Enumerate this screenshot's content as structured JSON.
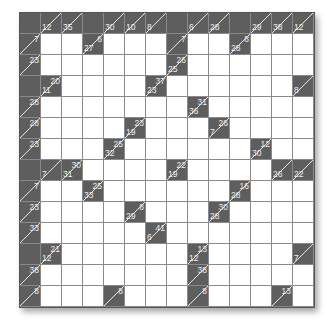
{
  "puzzle": {
    "type": "kakuro",
    "rows": 14,
    "cols": 14,
    "colors": {
      "block": "#5e5e5e",
      "empty": "#ffffff",
      "grid_line": "#8a8a8a",
      "clue_text": "#f0f0f0"
    },
    "grid": [
      [
        {
          "t": "b"
        },
        {
          "t": "c",
          "d": 12
        },
        {
          "t": "c",
          "d": 35
        },
        {
          "t": "b"
        },
        {
          "t": "c",
          "d": 30
        },
        {
          "t": "c",
          "d": 10
        },
        {
          "t": "c",
          "d": 8
        },
        {
          "t": "b"
        },
        {
          "t": "c",
          "d": 6
        },
        {
          "t": "c",
          "d": 28
        },
        {
          "t": "b"
        },
        {
          "t": "c",
          "d": 29
        },
        {
          "t": "c",
          "d": 38
        },
        {
          "t": "c",
          "d": 12
        }
      ],
      [
        {
          "t": "c",
          "a": 7
        },
        {
          "t": "w"
        },
        {
          "t": "w"
        },
        {
          "t": "c",
          "d": 27,
          "a": 6
        },
        {
          "t": "w"
        },
        {
          "t": "w"
        },
        {
          "t": "w"
        },
        {
          "t": "c",
          "a": 7
        },
        {
          "t": "w"
        },
        {
          "t": "w"
        },
        {
          "t": "c",
          "d": 28,
          "a": 8
        },
        {
          "t": "w"
        },
        {
          "t": "w"
        },
        {
          "t": "w"
        }
      ],
      [
        {
          "t": "c",
          "a": 23
        },
        {
          "t": "w"
        },
        {
          "t": "w"
        },
        {
          "t": "w"
        },
        {
          "t": "w"
        },
        {
          "t": "w"
        },
        {
          "t": "w"
        },
        {
          "t": "c",
          "d": 25,
          "a": 26
        },
        {
          "t": "w"
        },
        {
          "t": "w"
        },
        {
          "t": "w"
        },
        {
          "t": "w"
        },
        {
          "t": "w"
        },
        {
          "t": "w"
        }
      ],
      [
        {
          "t": "b"
        },
        {
          "t": "c",
          "d": 11,
          "a": 20
        },
        {
          "t": "w"
        },
        {
          "t": "w"
        },
        {
          "t": "w"
        },
        {
          "t": "w"
        },
        {
          "t": "c",
          "d": 23,
          "a": 37
        },
        {
          "t": "w"
        },
        {
          "t": "w"
        },
        {
          "t": "w"
        },
        {
          "t": "w"
        },
        {
          "t": "w"
        },
        {
          "t": "w"
        },
        {
          "t": "c",
          "d": 8
        }
      ],
      [
        {
          "t": "c",
          "a": 28
        },
        {
          "t": "w"
        },
        {
          "t": "w"
        },
        {
          "t": "w"
        },
        {
          "t": "w"
        },
        {
          "t": "w"
        },
        {
          "t": "w"
        },
        {
          "t": "w"
        },
        {
          "t": "c",
          "d": 36,
          "a": 31
        },
        {
          "t": "w"
        },
        {
          "t": "w"
        },
        {
          "t": "w"
        },
        {
          "t": "w"
        },
        {
          "t": "w"
        }
      ],
      [
        {
          "t": "c",
          "a": 28
        },
        {
          "t": "w"
        },
        {
          "t": "w"
        },
        {
          "t": "w"
        },
        {
          "t": "w"
        },
        {
          "t": "c",
          "d": 19,
          "a": 23
        },
        {
          "t": "w"
        },
        {
          "t": "w"
        },
        {
          "t": "w"
        },
        {
          "t": "c",
          "d": 7,
          "a": 26
        },
        {
          "t": "w"
        },
        {
          "t": "w"
        },
        {
          "t": "w"
        },
        {
          "t": "w"
        }
      ],
      [
        {
          "t": "c",
          "a": 23
        },
        {
          "t": "w"
        },
        {
          "t": "w"
        },
        {
          "t": "w"
        },
        {
          "t": "c",
          "d": 32,
          "a": 25
        },
        {
          "t": "w"
        },
        {
          "t": "w"
        },
        {
          "t": "w"
        },
        {
          "t": "w"
        },
        {
          "t": "w"
        },
        {
          "t": "w"
        },
        {
          "t": "c",
          "d": 30,
          "a": 12
        },
        {
          "t": "w"
        },
        {
          "t": "w"
        }
      ],
      [
        {
          "t": "b"
        },
        {
          "t": "c",
          "d": 7
        },
        {
          "t": "c",
          "d": 31,
          "a": 30
        },
        {
          "t": "w"
        },
        {
          "t": "w"
        },
        {
          "t": "w"
        },
        {
          "t": "w"
        },
        {
          "t": "c",
          "d": 19,
          "a": 22
        },
        {
          "t": "w"
        },
        {
          "t": "w"
        },
        {
          "t": "w"
        },
        {
          "t": "w"
        },
        {
          "t": "c",
          "d": 26
        },
        {
          "t": "c",
          "d": 22
        }
      ],
      [
        {
          "t": "c",
          "a": 7
        },
        {
          "t": "w"
        },
        {
          "t": "w"
        },
        {
          "t": "c",
          "d": 33,
          "a": 25
        },
        {
          "t": "w"
        },
        {
          "t": "w"
        },
        {
          "t": "w"
        },
        {
          "t": "w"
        },
        {
          "t": "w"
        },
        {
          "t": "w"
        },
        {
          "t": "c",
          "d": 28,
          "a": 16
        },
        {
          "t": "w"
        },
        {
          "t": "w"
        },
        {
          "t": "w"
        }
      ],
      [
        {
          "t": "c",
          "a": 23
        },
        {
          "t": "w"
        },
        {
          "t": "w"
        },
        {
          "t": "w"
        },
        {
          "t": "w"
        },
        {
          "t": "c",
          "d": 29,
          "a": 8
        },
        {
          "t": "w"
        },
        {
          "t": "w"
        },
        {
          "t": "w"
        },
        {
          "t": "c",
          "d": 28,
          "a": 30
        },
        {
          "t": "w"
        },
        {
          "t": "w"
        },
        {
          "t": "w"
        },
        {
          "t": "w"
        }
      ],
      [
        {
          "t": "c",
          "a": 33
        },
        {
          "t": "w"
        },
        {
          "t": "w"
        },
        {
          "t": "w"
        },
        {
          "t": "w"
        },
        {
          "t": "w"
        },
        {
          "t": "c",
          "d": 6,
          "a": 41
        },
        {
          "t": "w"
        },
        {
          "t": "w"
        },
        {
          "t": "w"
        },
        {
          "t": "w"
        },
        {
          "t": "w"
        },
        {
          "t": "w"
        },
        {
          "t": "w"
        }
      ],
      [
        {
          "t": "b"
        },
        {
          "t": "c",
          "d": 12,
          "a": 21
        },
        {
          "t": "w"
        },
        {
          "t": "w"
        },
        {
          "t": "w"
        },
        {
          "t": "w"
        },
        {
          "t": "w"
        },
        {
          "t": "w"
        },
        {
          "t": "c",
          "d": 12,
          "a": 13
        },
        {
          "t": "w"
        },
        {
          "t": "w"
        },
        {
          "t": "w"
        },
        {
          "t": "w"
        },
        {
          "t": "c",
          "d": 7
        }
      ],
      [
        {
          "t": "c",
          "a": 38
        },
        {
          "t": "w"
        },
        {
          "t": "w"
        },
        {
          "t": "w"
        },
        {
          "t": "w"
        },
        {
          "t": "w"
        },
        {
          "t": "w"
        },
        {
          "t": "w"
        },
        {
          "t": "c",
          "a": 38
        },
        {
          "t": "w"
        },
        {
          "t": "w"
        },
        {
          "t": "w"
        },
        {
          "t": "w"
        },
        {
          "t": "w"
        }
      ],
      [
        {
          "t": "c",
          "a": 8
        },
        {
          "t": "w"
        },
        {
          "t": "w"
        },
        {
          "t": "w"
        },
        {
          "t": "c",
          "a": 8
        },
        {
          "t": "w"
        },
        {
          "t": "w"
        },
        {
          "t": "w"
        },
        {
          "t": "c",
          "a": 8
        },
        {
          "t": "w"
        },
        {
          "t": "w"
        },
        {
          "t": "w"
        },
        {
          "t": "c",
          "a": 13
        },
        {
          "t": "w"
        }
      ]
    ]
  }
}
